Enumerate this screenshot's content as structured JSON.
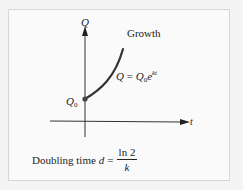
{
  "figure": {
    "title": "Growth",
    "y_axis_label": "Q",
    "x_axis_label": "t",
    "initial_value_label": {
      "base": "Q",
      "subscript": "0"
    },
    "curve_equation": {
      "lhs": "Q",
      "equals": "=",
      "base": "Q",
      "subscript": "0",
      "e": "e",
      "exponent": "kt"
    },
    "doubling_time": {
      "prefix": "Doubling time",
      "variable": "d",
      "equals": "=",
      "numerator": "ln 2",
      "denominator": "k"
    }
  },
  "colors": {
    "background": "#f4f4f4",
    "panel": "#fafafa",
    "border": "#d6d6d6",
    "ink": "#222222",
    "curve": "#333333"
  }
}
